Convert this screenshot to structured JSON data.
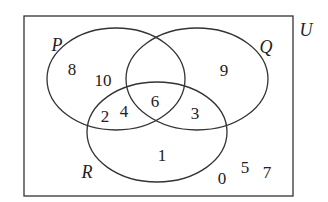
{
  "diagram": {
    "type": "venn",
    "universal_set": "U",
    "sets": {
      "P": "P",
      "Q": "Q",
      "R": "R"
    },
    "regions": {
      "P_only": [
        "8",
        "10"
      ],
      "Q_only": [
        "9"
      ],
      "R_only": [
        "1"
      ],
      "P_and_Q_and_R": [
        "6"
      ],
      "P_and_R_only": [
        "2",
        "4"
      ],
      "Q_and_R_only": [
        "3"
      ],
      "P_and_Q_only": [],
      "outside": [
        "0",
        "5",
        "7"
      ]
    },
    "colors": {
      "stroke": "#333333",
      "text": "#222222",
      "background": "#ffffff"
    }
  }
}
